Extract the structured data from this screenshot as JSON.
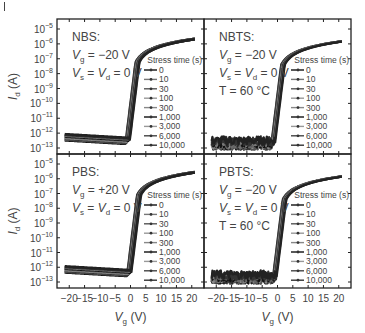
{
  "figure": {
    "y_label": "I",
    "y_label_sub": "d",
    "y_label_unit": " (A)",
    "x_label": "V",
    "x_label_sub": "g",
    "x_label_unit": " (V)"
  },
  "chart_data": [
    {
      "type": "line",
      "panel": "top-left",
      "title": "NBS:",
      "annotations": [
        "V_g = −20 V",
        "V_s = V_d = 0 V"
      ],
      "xlabel": "V_g (V)",
      "ylabel": "I_d (A)",
      "yscale": "log",
      "ylim": [
        1e-13,
        1e-05
      ],
      "xlim": [
        -24,
        24
      ],
      "x_ticks": [
        -20,
        -15,
        -10,
        -5,
        0,
        5,
        10,
        15,
        20
      ],
      "y_ticks": [
        "10^-5",
        "10^-6",
        "10^-7",
        "10^-8",
        "10^-9",
        "10^-10",
        "10^-11",
        "10^-12",
        "10^-13"
      ],
      "legend_title": "Stress time (s)",
      "legend": [
        "0",
        "10",
        "30",
        "100",
        "300",
        "1,000",
        "3,000",
        "6,000",
        "10,000"
      ],
      "curve": {
        "off_current": 3e-13,
        "turn_on_vg": -1.5,
        "on_current_at_20": 2e-05
      }
    },
    {
      "type": "line",
      "panel": "top-right",
      "title": "NBTS:",
      "annotations": [
        "V_g = −20 V",
        "V_s = V_d = 0 V",
        "T = 60 °C"
      ],
      "xlabel": "V_g (V)",
      "ylabel": "I_d (A)",
      "yscale": "log",
      "ylim": [
        1e-13,
        1e-05
      ],
      "xlim": [
        -24,
        24
      ],
      "legend_title": "Stress time (s)",
      "legend": [
        "0",
        "10",
        "30",
        "100",
        "300",
        "1,000",
        "3,000",
        "6,000",
        "10,000"
      ],
      "curve": {
        "off_current": 2e-13,
        "turn_on_vg": -2.0,
        "on_current_at_20": 2e-05
      }
    },
    {
      "type": "line",
      "panel": "bottom-left",
      "title": "PBS:",
      "annotations": [
        "V_g = +20 V",
        "V_s = V_d = 0 V"
      ],
      "xlabel": "V_g (V)",
      "ylabel": "I_d (A)",
      "yscale": "log",
      "ylim": [
        1e-13,
        1e-05
      ],
      "xlim": [
        -24,
        24
      ],
      "x_ticks": [
        -20,
        -15,
        -10,
        -5,
        0,
        5,
        10,
        15,
        20
      ],
      "legend_title": "Stress time (s)",
      "legend": [
        "0",
        "10",
        "30",
        "100",
        "300",
        "1,000",
        "3,000",
        "6,000",
        "10,000"
      ],
      "curve": {
        "off_current": 4e-13,
        "turn_on_vg": -1.0,
        "on_current_at_20": 2e-05
      }
    },
    {
      "type": "line",
      "panel": "bottom-right",
      "title": "PBTS:",
      "annotations": [
        "V_g = −20 V",
        "V_s = V_d = 0 V",
        "T = 60 °C"
      ],
      "xlabel": "V_g (V)",
      "ylabel": "I_d (A)",
      "yscale": "log",
      "ylim": [
        1e-13,
        1e-05
      ],
      "xlim": [
        -24,
        24
      ],
      "x_ticks": [
        -20,
        -15,
        -10,
        -5,
        0,
        5,
        10,
        15,
        20
      ],
      "legend_title": "Stress time (s)",
      "legend": [
        "0",
        "10",
        "30",
        "100",
        "300",
        "1,000",
        "3,000",
        "6,000",
        "10,000"
      ],
      "curve": {
        "off_current": 2e-13,
        "turn_on_vg": -1.5,
        "on_current_at_20": 2e-05
      }
    }
  ]
}
